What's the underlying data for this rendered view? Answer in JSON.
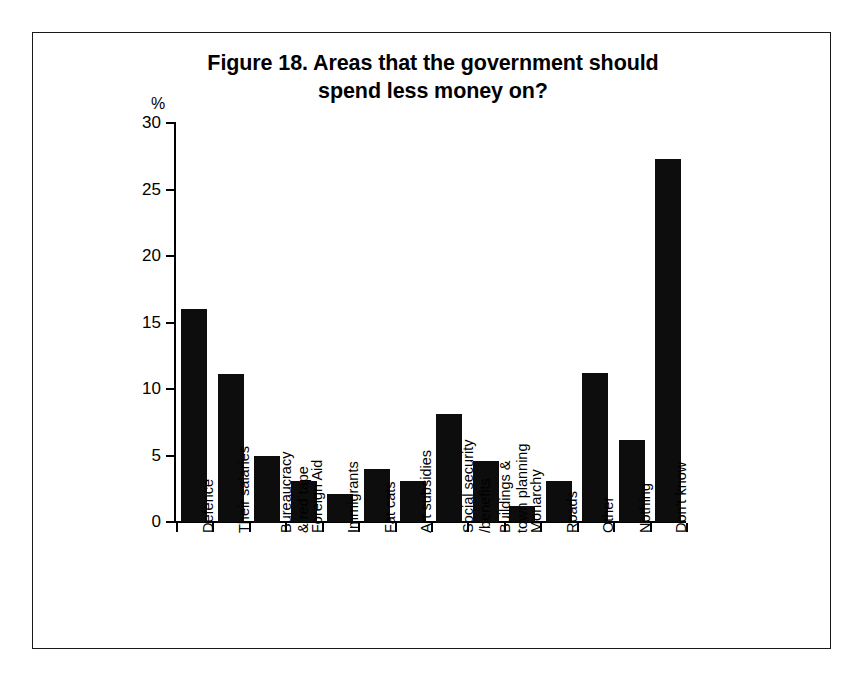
{
  "figure": {
    "title_line1": "Figure 18. Areas that the government should",
    "title_line2": "spend less money on?",
    "border_color": "#1a1a1a",
    "background": "#ffffff"
  },
  "chart_data": {
    "type": "bar",
    "title": "Figure 18. Areas that the government should spend less money on?",
    "xlabel": "",
    "ylabel": "%",
    "ylim": [
      0,
      30
    ],
    "ytick_labels": [
      "0",
      "5",
      "10",
      "15",
      "20",
      "25",
      "30"
    ],
    "yticks": [
      0,
      5,
      10,
      15,
      20,
      25,
      30
    ],
    "grid": false,
    "legend": false,
    "bar_color": "#0d0d0d",
    "categories": [
      "Defence",
      "Their salaries",
      "Bureaucracy\n& red tape",
      "Foreign Aid",
      "Immigrants",
      "Fat cats",
      "Art subsidies",
      "Social security\n/benefits",
      "Buildings &\ntown planning",
      "Monarchy",
      "Roads",
      "Other",
      "Nothing",
      "Don't know"
    ],
    "values": [
      16.0,
      11.1,
      5.0,
      3.1,
      2.1,
      4.0,
      3.1,
      8.1,
      4.6,
      1.2,
      3.1,
      11.2,
      6.2,
      27.3
    ]
  }
}
